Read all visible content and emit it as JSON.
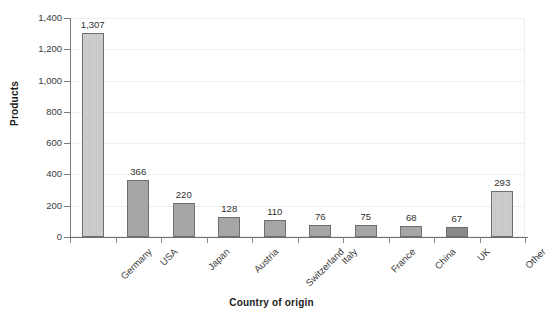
{
  "chart_data": {
    "type": "bar",
    "title": "",
    "xlabel": "Country of origin",
    "ylabel": "Products",
    "categories": [
      "Germany",
      "USA",
      "Japan",
      "Austria",
      "Switzerland",
      "Italy",
      "France",
      "China",
      "UK",
      "Other"
    ],
    "values": [
      1307,
      366,
      220,
      128,
      110,
      76,
      75,
      68,
      67,
      293
    ],
    "value_labels": [
      "1,307",
      "366",
      "220",
      "128",
      "110",
      "76",
      "75",
      "68",
      "67",
      "293"
    ],
    "ylim": [
      0,
      1400
    ],
    "ytick_values": [
      0,
      200,
      400,
      600,
      800,
      1000,
      1200,
      1400
    ],
    "ytick_labels": [
      "0",
      "200",
      "400",
      "600",
      "800",
      "1,000",
      "1,200",
      "1,400"
    ],
    "grid": true,
    "legend": false,
    "bar_styles": [
      "light",
      "mid",
      "mid",
      "mid",
      "mid",
      "mid",
      "mid",
      "mid",
      "dark",
      "light"
    ],
    "colors": {
      "bar_light": "#cacaca",
      "bar_mid": "#a6a6a6",
      "bar_dark": "#8a8a8a",
      "bar_border": "#6f6f6f",
      "gridline": "#efefef",
      "axis": "#6e6e6e",
      "text": "#2f2f2f",
      "background": "#ffffff"
    }
  }
}
